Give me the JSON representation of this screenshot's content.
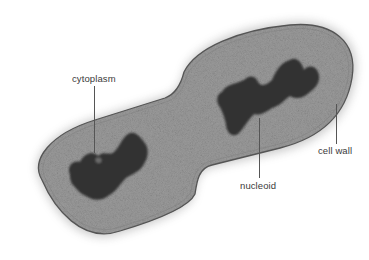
{
  "figure": {
    "background": "#ffffff",
    "colors": {
      "cytoplasm": "#9a9a9a",
      "nucleoid": "#2f2f2f",
      "cell_wall": "#5a5a5a",
      "label_text": "#3a3a3a",
      "leader_line": "#555555"
    }
  },
  "labels": {
    "cytoplasm": "cytoplasm",
    "nucleoid": "nucleoid",
    "cell_wall": "cell wall"
  }
}
